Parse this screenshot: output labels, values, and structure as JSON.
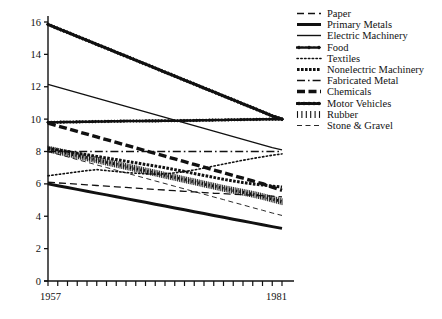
{
  "chart_data": {
    "type": "line",
    "title": "",
    "xlabel": "",
    "ylabel": "",
    "xlim": [
      1957,
      1981
    ],
    "ylim": [
      0,
      16
    ],
    "yticks": [
      0,
      2,
      4,
      6,
      8,
      10,
      12,
      14,
      16
    ],
    "xticks": [
      1957,
      1958,
      1959,
      1960,
      1961,
      1962,
      1963,
      1964,
      1965,
      1966,
      1967,
      1968,
      1969,
      1970,
      1971,
      1972,
      1973,
      1974,
      1975,
      1976,
      1977,
      1978,
      1979,
      1980,
      1981
    ],
    "xtick_labels_shown": [
      "1957",
      "1981"
    ],
    "grid": false,
    "legend_position": "right",
    "x": [
      1957,
      1958,
      1959,
      1960,
      1961,
      1962,
      1963,
      1964,
      1965,
      1966,
      1967,
      1968,
      1969,
      1970,
      1971,
      1972,
      1973,
      1974,
      1975,
      1976,
      1977,
      1978,
      1979,
      1980,
      1981
    ],
    "series": [
      {
        "name": "Paper",
        "style": "dashed",
        "width": 1.3,
        "values": [
          6.1,
          6.06,
          6.02,
          5.98,
          5.94,
          5.9,
          5.86,
          5.82,
          5.78,
          5.74,
          5.7,
          5.66,
          5.62,
          5.58,
          5.54,
          5.5,
          5.46,
          5.42,
          5.4,
          5.36,
          5.33,
          5.3,
          5.27,
          5.24,
          5.2
        ]
      },
      {
        "name": "Primary Metals",
        "style": "thick-solid",
        "width": 3.0,
        "values": [
          6.0,
          5.89,
          5.78,
          5.66,
          5.55,
          5.43,
          5.32,
          5.2,
          5.09,
          4.97,
          4.86,
          4.74,
          4.63,
          4.51,
          4.4,
          4.28,
          4.17,
          4.05,
          3.94,
          3.82,
          3.71,
          3.59,
          3.48,
          3.36,
          3.25
        ]
      },
      {
        "name": "Electric Machinery",
        "style": "solid",
        "width": 1.4,
        "values": [
          12.15,
          11.98,
          11.81,
          11.64,
          11.47,
          11.3,
          11.13,
          10.96,
          10.79,
          10.62,
          10.45,
          10.28,
          10.11,
          9.94,
          9.77,
          9.6,
          9.43,
          9.26,
          9.09,
          8.92,
          8.75,
          8.58,
          8.41,
          8.24,
          8.1
        ]
      },
      {
        "name": "Food",
        "style": "dotted-marker",
        "width": 2.6,
        "values": [
          9.8,
          9.81,
          9.82,
          9.83,
          9.84,
          9.85,
          9.86,
          9.87,
          9.88,
          9.88,
          9.89,
          9.89,
          9.9,
          9.9,
          9.91,
          9.92,
          9.93,
          9.94,
          9.95,
          9.96,
          9.97,
          9.98,
          9.99,
          10.0,
          10.0
        ]
      },
      {
        "name": "Textiles",
        "style": "fine-dotted",
        "width": 1.6,
        "values": [
          6.5,
          6.58,
          6.66,
          6.74,
          6.82,
          6.88,
          6.82,
          6.76,
          6.7,
          6.66,
          6.62,
          6.6,
          6.62,
          6.68,
          6.76,
          6.86,
          6.98,
          7.1,
          7.22,
          7.34,
          7.46,
          7.57,
          7.67,
          7.77,
          7.85
        ]
      },
      {
        "name": "Nonelectric Machinery",
        "style": "thick-dotted",
        "width": 3.0,
        "values": [
          8.2,
          8.1,
          8.0,
          7.9,
          7.8,
          7.7,
          7.6,
          7.5,
          7.4,
          7.3,
          7.2,
          7.1,
          7.0,
          6.88,
          6.76,
          6.64,
          6.52,
          6.4,
          6.28,
          6.18,
          6.08,
          6.0,
          5.93,
          5.86,
          5.8
        ]
      },
      {
        "name": "Fabricated Metal",
        "style": "dash-dot",
        "width": 1.4,
        "values": [
          8.0,
          8.0,
          8.0,
          8.0,
          8.0,
          8.0,
          8.0,
          8.0,
          8.0,
          8.0,
          8.0,
          8.0,
          8.0,
          8.0,
          8.0,
          8.0,
          8.0,
          8.0,
          8.0,
          8.0,
          8.0,
          8.0,
          8.0,
          8.0,
          8.0
        ]
      },
      {
        "name": "Chemicals",
        "style": "thick-dashed",
        "width": 3.4,
        "values": [
          9.75,
          9.58,
          9.41,
          9.24,
          9.07,
          8.9,
          8.73,
          8.56,
          8.39,
          8.22,
          8.05,
          7.88,
          7.71,
          7.54,
          7.37,
          7.2,
          7.03,
          6.86,
          6.69,
          6.52,
          6.35,
          6.18,
          6.01,
          5.8,
          5.6
        ]
      },
      {
        "name": "Motor Vehicles",
        "style": "thick-dotted-marker",
        "width": 3.0,
        "values": [
          15.85,
          15.6,
          15.36,
          15.11,
          14.87,
          14.62,
          14.38,
          14.13,
          13.89,
          13.64,
          13.4,
          13.15,
          12.9,
          12.66,
          12.41,
          12.17,
          11.92,
          11.68,
          11.43,
          11.19,
          10.94,
          10.7,
          10.45,
          10.2,
          10.0
        ]
      },
      {
        "name": "Rubber",
        "style": "hatched",
        "width": 3.0,
        "values": [
          8.15,
          8.02,
          7.88,
          7.75,
          7.61,
          7.48,
          7.34,
          7.21,
          7.07,
          6.94,
          6.8,
          6.67,
          6.53,
          6.4,
          6.26,
          6.13,
          5.99,
          5.86,
          5.72,
          5.6,
          5.48,
          5.36,
          5.22,
          5.06,
          4.9
        ]
      },
      {
        "name": "Stone & Gravel",
        "style": "thin-dashed",
        "width": 0.9,
        "values": [
          8.0,
          7.83,
          7.67,
          7.5,
          7.34,
          7.17,
          7.01,
          6.84,
          6.68,
          6.51,
          6.35,
          6.18,
          6.02,
          5.85,
          5.69,
          5.52,
          5.36,
          5.19,
          5.03,
          4.86,
          4.7,
          4.53,
          4.37,
          4.2,
          4.05
        ]
      }
    ]
  },
  "legend": {
    "items": [
      {
        "label": "Paper",
        "sample": "dashed-sample"
      },
      {
        "label": "Primary Metals",
        "sample": "thick-solid-sample"
      },
      {
        "label": "Electric Machinery",
        "sample": "solid-sample"
      },
      {
        "label": "Food",
        "sample": "dotted-marker-sample"
      },
      {
        "label": "Textiles",
        "sample": "fine-dotted-sample"
      },
      {
        "label": "Nonelectric Machinery",
        "sample": "thick-dotted-sample"
      },
      {
        "label": "Fabricated Metal",
        "sample": "dash-dot-sample"
      },
      {
        "label": "Chemicals",
        "sample": "thick-dashed-sample"
      },
      {
        "label": "Motor Vehicles",
        "sample": "thick-dotted-marker-sample"
      },
      {
        "label": "Rubber",
        "sample": "hatched-sample"
      },
      {
        "label": "Stone & Gravel",
        "sample": "thin-dashed-sample"
      }
    ]
  },
  "axes": {
    "y_labels": [
      "16",
      "14",
      "12",
      "10",
      "8",
      "6",
      "4",
      "2",
      "0"
    ],
    "x_label_left": "1957",
    "x_label_right": "1981"
  },
  "colors": {
    "ink": "#111111",
    "background": "#ffffff"
  }
}
